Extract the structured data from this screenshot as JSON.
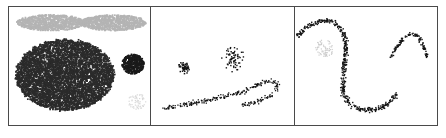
{
  "figure": {
    "title": "",
    "panel_count": 3,
    "background_color": "#ffffff",
    "frame_color": "#4a4a4a"
  },
  "chart_data": {
    "type": "scatter",
    "title": "",
    "xlabel": "",
    "ylabel": "",
    "grid": false,
    "legend": "none",
    "panels": [
      {
        "id": "panel-a",
        "label": "",
        "xlim": [
          0,
          141
        ],
        "ylim": [
          0,
          120
        ],
        "description": "dense filled clusters",
        "objects": [
          {
            "name": "gray-cloud-left",
            "kind": "filled-blob",
            "color": "#b4b4b4",
            "cx": 42,
            "cy": 16,
            "rx": 34,
            "ry": 8,
            "point_count": 900
          },
          {
            "name": "gray-cloud-right",
            "kind": "filled-blob",
            "color": "#b4b4b4",
            "cx": 104,
            "cy": 16,
            "rx": 33,
            "ry": 8,
            "point_count": 880
          },
          {
            "name": "large-dark-ellipse",
            "kind": "filled-blob",
            "color": "#2b2b2b",
            "cx": 56,
            "cy": 69,
            "rx": 49,
            "ry": 36,
            "point_count": 5200
          },
          {
            "name": "small-dark-blob",
            "kind": "filled-blob",
            "color": "#1a1a1a",
            "cx": 124,
            "cy": 58,
            "rx": 11,
            "ry": 10,
            "point_count": 420
          },
          {
            "name": "faint-gray-speckle",
            "kind": "sparse-speckle",
            "color": "#d8d8d8",
            "cx": 128,
            "cy": 96,
            "rx": 9,
            "ry": 8,
            "point_count": 60
          }
        ]
      },
      {
        "id": "panel-b",
        "label": "",
        "xlim": [
          0,
          144
        ],
        "ylim": [
          0,
          120
        ],
        "description": "discrete point clusters and a dotted arc",
        "objects": [
          {
            "name": "small-tight-cluster",
            "kind": "point-cluster",
            "color": "#141414",
            "cx": 34,
            "cy": 62,
            "rx": 8,
            "ry": 8,
            "point_count": 55,
            "dot_size": 1.5
          },
          {
            "name": "scattered-round-cluster",
            "kind": "point-cluster",
            "color": "#141414",
            "cx": 84,
            "cy": 53,
            "rx": 18,
            "ry": 18,
            "point_count": 70,
            "dot_size": 1.4
          },
          {
            "name": "dotted-arc-band",
            "kind": "point-band",
            "color": "#141414",
            "point_count": 260,
            "dot_size": 1.3
          }
        ]
      },
      {
        "id": "panel-c",
        "label": "",
        "xlim": [
          0,
          143
        ],
        "ylim": [
          0,
          120
        ],
        "description": "large dotted hook curve and small dotted caret",
        "objects": [
          {
            "name": "large-hook-curve",
            "kind": "point-band",
            "color": "#141414",
            "point_count": 420,
            "dot_size": 1.4
          },
          {
            "name": "faint-gray-patch",
            "kind": "sparse-speckle",
            "color": "#cccccc",
            "cx": 30,
            "cy": 42,
            "rx": 10,
            "ry": 9,
            "point_count": 70
          },
          {
            "name": "small-caret-curve",
            "kind": "point-band",
            "color": "#141414",
            "point_count": 110,
            "dot_size": 1.4
          }
        ]
      }
    ]
  }
}
